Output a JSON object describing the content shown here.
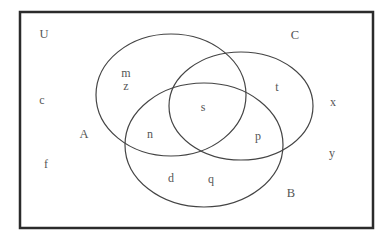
{
  "diagram": {
    "type": "venn",
    "universal_set_label": "U",
    "sets": [
      {
        "name": "A",
        "label": "A",
        "ellipse": {
          "cx": 171,
          "cy": 95,
          "rx": 75,
          "ry": 61
        }
      },
      {
        "name": "C",
        "label": "C",
        "ellipse": {
          "cx": 241,
          "cy": 106,
          "rx": 72,
          "ry": 54
        }
      },
      {
        "name": "B",
        "label": "B",
        "ellipse": {
          "cx": 204,
          "cy": 145,
          "rx": 79,
          "ry": 62
        }
      }
    ],
    "frame": {
      "x": 20,
      "y": 12,
      "width": 353,
      "height": 216
    },
    "regions": {
      "A_only": [
        "m",
        "z"
      ],
      "C_only": [
        "t"
      ],
      "B_only": [
        "d",
        "q"
      ],
      "A_and_B_only": [
        "n"
      ],
      "B_and_C_only": [
        "p"
      ],
      "A_and_B_and_C": [
        "s"
      ],
      "A_and_C_only": [],
      "outside": [
        "c",
        "f",
        "x",
        "y"
      ]
    },
    "labels": [
      {
        "id": "U",
        "text": "U",
        "x": 44,
        "y": 34,
        "kind": "set-name"
      },
      {
        "id": "C",
        "text": "C",
        "x": 295,
        "y": 35,
        "kind": "set-name"
      },
      {
        "id": "A",
        "text": "A",
        "x": 84,
        "y": 134,
        "kind": "set-name"
      },
      {
        "id": "B",
        "text": "B",
        "x": 291,
        "y": 193,
        "kind": "set-name"
      },
      {
        "id": "m",
        "text": "m",
        "x": 126,
        "y": 73,
        "kind": "element"
      },
      {
        "id": "z",
        "text": "z",
        "x": 126,
        "y": 86,
        "kind": "element"
      },
      {
        "id": "c",
        "text": "c",
        "x": 42,
        "y": 100,
        "kind": "element"
      },
      {
        "id": "t",
        "text": "t",
        "x": 277,
        "y": 87,
        "kind": "element"
      },
      {
        "id": "s",
        "text": "s",
        "x": 203,
        "y": 107,
        "kind": "element"
      },
      {
        "id": "x",
        "text": "x",
        "x": 333,
        "y": 102,
        "kind": "element"
      },
      {
        "id": "n",
        "text": "n",
        "x": 150,
        "y": 134,
        "kind": "element"
      },
      {
        "id": "p",
        "text": "p",
        "x": 258,
        "y": 136,
        "kind": "element"
      },
      {
        "id": "y",
        "text": "y",
        "x": 332,
        "y": 153,
        "kind": "element"
      },
      {
        "id": "f",
        "text": "f",
        "x": 46,
        "y": 164,
        "kind": "element"
      },
      {
        "id": "d",
        "text": "d",
        "x": 171,
        "y": 178,
        "kind": "element"
      },
      {
        "id": "q",
        "text": "q",
        "x": 211,
        "y": 179,
        "kind": "element"
      }
    ]
  },
  "colors": {
    "frame": "#2b2b2b",
    "ellipse": "#444444",
    "text": "#555555",
    "background": "#ffffff"
  }
}
